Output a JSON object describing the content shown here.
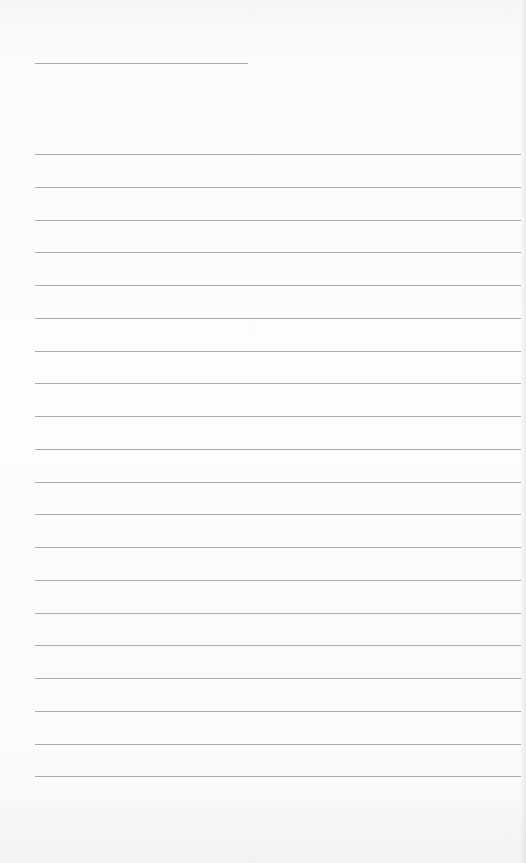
{
  "page": {
    "type": "lined-paper",
    "background_color": "#fdfdfd",
    "line_color": "#ababab",
    "header_line": {
      "left": 35,
      "top": 63,
      "width": 213
    },
    "rules": {
      "count": 20,
      "left": 35,
      "width": 486,
      "first_top": 154,
      "spacing": 32.75
    }
  }
}
